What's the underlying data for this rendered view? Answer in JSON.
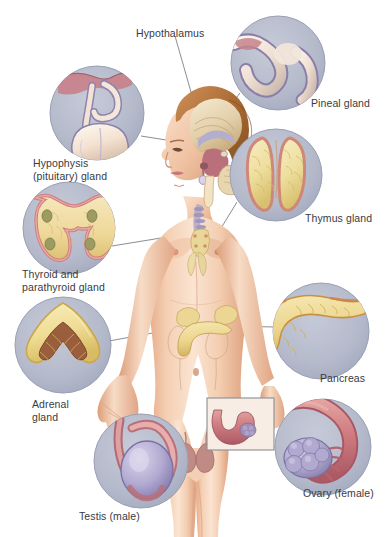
{
  "figure": {
    "background_color": "#ffffff"
  },
  "palette": {
    "inset_circle_fill": "#b6bbcc",
    "inset_circle_edge": "#9aa0b4",
    "leader_line": "#6f6f78",
    "label_text": "#3a3a42",
    "skin_light": "#f6d9c4",
    "skin_mid": "#eebfa0",
    "skin_shadow": "#d99c78",
    "skin_deep": "#c07d5c",
    "hair_light": "#c98a52",
    "hair_dark": "#8d5426",
    "gland_yellow": "#efd98a",
    "gland_yellow_dark": "#d9b455",
    "gland_pink": "#e59a96",
    "gland_rose": "#c96f78",
    "gland_mauve": "#a58fb5",
    "gland_purple": "#8d85b8",
    "brain_cream": "#f0e2c8",
    "brain_tan": "#d8c39a",
    "brain_rose": "#b9707a",
    "brain_lilac": "#b3aece",
    "uterus_maroon": "#9e4f63",
    "ovary_lilac": "#a39ec6",
    "inset_box_border": "#8d8d95"
  },
  "labels": [
    {
      "id": "hypothalamus",
      "text": "Hypothalamus",
      "x": 136,
      "y": 27,
      "align": "left"
    },
    {
      "id": "hypophysis",
      "text": "Hypophysis\n(pituitary) gland",
      "x": 33,
      "y": 157,
      "align": "left"
    },
    {
      "id": "thyroid-parathyroid",
      "text": "Thyroid and\nparathyroid gland",
      "x": 22,
      "y": 268,
      "align": "left"
    },
    {
      "id": "adrenal",
      "text": "Adrenal\ngland",
      "x": 32,
      "y": 398,
      "align": "left"
    },
    {
      "id": "testis",
      "text": "Testis (male)",
      "x": 79,
      "y": 510,
      "align": "left"
    },
    {
      "id": "pineal",
      "text": "Pineal gland",
      "x": 311,
      "y": 97,
      "align": "left"
    },
    {
      "id": "thymus",
      "text": "Thymus gland",
      "x": 305,
      "y": 212,
      "align": "left"
    },
    {
      "id": "pancreas",
      "text": "Pancreas",
      "x": 320,
      "y": 372,
      "align": "left"
    },
    {
      "id": "ovary",
      "text": "Ovary (female)",
      "x": 303,
      "y": 487,
      "align": "left"
    }
  ],
  "insets": [
    {
      "id": "hypophysis-inset",
      "gland": "Hypophysis (pituitary) gland",
      "cx": 97,
      "cy": 113,
      "r": 47
    },
    {
      "id": "thyroid-inset",
      "gland": "Thyroid and parathyroid gland",
      "cx": 69,
      "cy": 228,
      "r": 46
    },
    {
      "id": "adrenal-inset",
      "gland": "Adrenal gland",
      "cx": 63,
      "cy": 345,
      "r": 48
    },
    {
      "id": "testis-inset",
      "gland": "Testis (male)",
      "cx": 141,
      "cy": 461,
      "r": 47
    },
    {
      "id": "pineal-inset",
      "gland": "Pineal gland",
      "cx": 278,
      "cy": 63,
      "r": 47
    },
    {
      "id": "thymus-inset",
      "gland": "Thymus gland",
      "cx": 276,
      "cy": 175,
      "r": 46
    },
    {
      "id": "pancreas-inset",
      "gland": "Pancreas",
      "cx": 321,
      "cy": 331,
      "r": 48
    },
    {
      "id": "ovary-inset",
      "gland": "Ovary (female)",
      "cx": 323,
      "cy": 447,
      "r": 48
    }
  ],
  "leader_lines": [
    {
      "id": "hypothalamus-leader",
      "from": [
        175,
        35
      ],
      "to": [
        198,
        118
      ]
    },
    {
      "id": "hypophysis-leader",
      "from": [
        141,
        135
      ],
      "to": [
        196,
        144
      ]
    },
    {
      "id": "thyroid-leader",
      "from": [
        112,
        246
      ],
      "to": [
        208,
        229
      ]
    },
    {
      "id": "adrenal-leader",
      "from": [
        109,
        341
      ],
      "to": [
        212,
        322
      ]
    },
    {
      "id": "testis-leader",
      "from": [
        186,
        452
      ],
      "to": [
        210,
        457
      ]
    },
    {
      "id": "pineal-leader",
      "from": [
        239,
        92
      ],
      "to": [
        212,
        127
      ]
    },
    {
      "id": "thymus-leader",
      "from": [
        236,
        201
      ],
      "to": [
        214,
        237
      ]
    },
    {
      "id": "pancreas-leader",
      "from": [
        276,
        327
      ],
      "to": [
        219,
        326
      ]
    },
    {
      "id": "ovary-leader",
      "from": [
        278,
        448
      ],
      "to": [
        234,
        437
      ]
    }
  ],
  "uterus_box": {
    "id": "uterus-ovary-box",
    "x": 207,
    "y": 398,
    "width": 67,
    "height": 52,
    "contents": "uterus with ovary (female reproductive inset)"
  }
}
